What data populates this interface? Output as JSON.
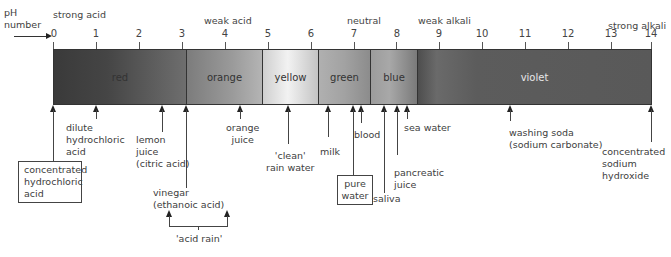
{
  "axis": {
    "label_line1": "pH",
    "label_line2": "number",
    "ticks": [
      "0",
      "1",
      "2",
      "3",
      "4",
      "5",
      "6",
      "7",
      "8",
      "9",
      "10",
      "11",
      "12",
      "13",
      "14"
    ]
  },
  "headers": {
    "strong_acid": "strong acid",
    "weak_acid": "weak acid",
    "neutral": "neutral",
    "weak_alkali": "weak alkali",
    "strong_alkali": "strong alkali"
  },
  "bands": [
    {
      "label": "red",
      "from": 0,
      "to": 3.1,
      "color_start": "#3a3a3a",
      "color_end": "#6e6e6e"
    },
    {
      "label": "orange",
      "from": 3.1,
      "to": 4.9,
      "color_start": "#7c7c7c",
      "color_end": "#a8a8a8"
    },
    {
      "label": "yellow",
      "from": 4.9,
      "to": 6.2,
      "color_start": "#d0d0d0",
      "color_end": "#b8b8b8"
    },
    {
      "label": "green",
      "from": 6.2,
      "to": 7.4,
      "color_start": "#a4a4a4",
      "color_end": "#8a8a8a"
    },
    {
      "label": "blue",
      "from": 7.4,
      "to": 8.5,
      "color_start": "#9a9a9a",
      "color_end": "#6a6a6a"
    },
    {
      "label": "violet",
      "from": 8.5,
      "to": 14,
      "color_start": "#606060",
      "color_end": "#585858"
    }
  ],
  "substances": {
    "conc_hcl": {
      "line1": "concentrated",
      "line2": "hydrochloric",
      "line3": "acid",
      "ph": 0
    },
    "dilute_hcl": {
      "line1": "dilute",
      "line2": "hydrochloric",
      "line3": "acid",
      "ph": 1
    },
    "lemon": {
      "line1": "lemon",
      "line2": "juice",
      "line3": "(citric acid)",
      "ph": 2.5
    },
    "vinegar": {
      "line1": "vinegar",
      "line2": "(ethanoic acid)",
      "ph": 3.1
    },
    "orange_juice": {
      "line1": "orange",
      "line2": "juice",
      "ph": 4.3
    },
    "clean_rain": {
      "line1": "'clean'",
      "line2": "rain water",
      "ph": 5.5
    },
    "milk": {
      "line1": "milk",
      "ph": 6.4
    },
    "pure_water": {
      "line1": "pure",
      "line2": "water",
      "ph": 7
    },
    "blood": {
      "line1": "blood",
      "ph": 7.2
    },
    "saliva": {
      "line1": "saliva",
      "ph": 7.7
    },
    "pancreatic": {
      "line1": "pancreatic",
      "line2": "juice",
      "ph": 8
    },
    "sea_water": {
      "line1": "sea water",
      "ph": 8.2
    },
    "washing_soda": {
      "line1": "washing soda",
      "line2": "(sodium carbonate)",
      "ph": 10.7
    },
    "conc_naoh": {
      "line1": "concentrated",
      "line2": "sodium",
      "line3": "hydroxide",
      "ph": 14
    }
  },
  "acid_rain": {
    "label": "'acid rain'",
    "range": [
      3,
      4.4
    ]
  }
}
